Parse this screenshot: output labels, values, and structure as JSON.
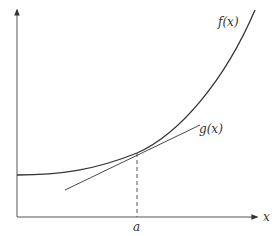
{
  "diagram": {
    "type": "tangent-line-illustration",
    "curves": {
      "f": {
        "label": "f(x)",
        "description": "convex increasing curve, flat on left, rising steeply on right"
      },
      "g": {
        "label": "g(x)",
        "description": "tangent line to f at x = a"
      }
    },
    "axes": {
      "x_label": "x",
      "x_tick_label": "a"
    },
    "colors": {
      "stroke": "#333333",
      "background": "#ffffff"
    }
  }
}
